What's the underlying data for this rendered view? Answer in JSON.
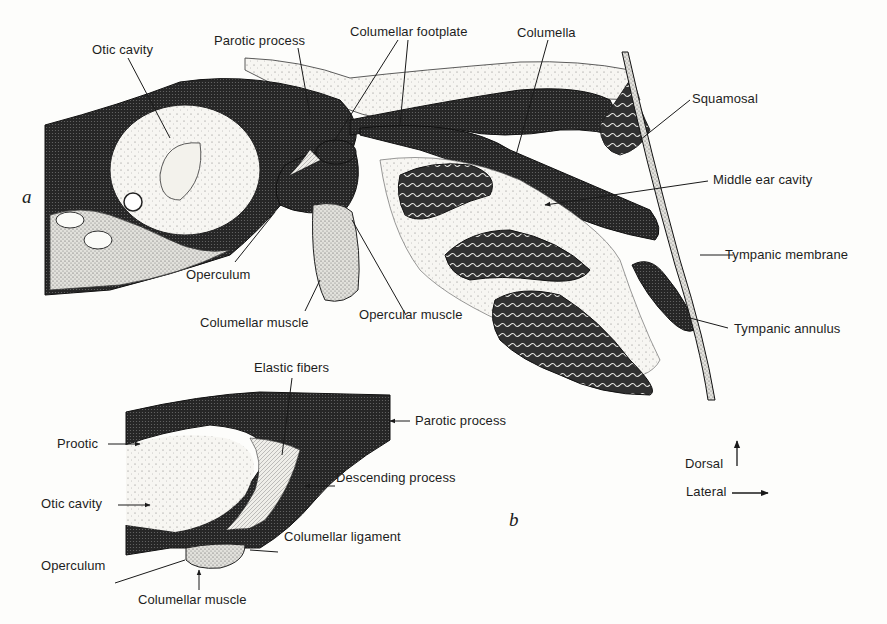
{
  "figure": {
    "panel_a": {
      "letter": "a",
      "labels": {
        "otic_cavity": "Otic cavity",
        "parotic_process": "Parotic process",
        "columellar_footplate": "Columellar footplate",
        "columella": "Columella",
        "squamosal": "Squamosal",
        "middle_ear_cavity": "Middle ear cavity",
        "tympanic_membrane": "Tympanic membrane",
        "tympanic_annulus": "Tympanic annulus",
        "operculum": "Operculum",
        "columellar_muscle": "Columellar muscle",
        "opercular_muscle": "Opercular muscle"
      }
    },
    "panel_b": {
      "letter": "b",
      "labels": {
        "elastic_fibers": "Elastic fibers",
        "parotic_process": "Parotic process",
        "prootic": "Prootic",
        "descending_process": "Descending process",
        "otic_cavity": "Otic cavity",
        "columellar_ligament": "Columellar ligament",
        "operculum": "Operculum",
        "columellar_muscle": "Columellar muscle"
      }
    },
    "orientation": {
      "dorsal": "Dorsal",
      "lateral": "Lateral"
    },
    "colors": {
      "dark_tissue": "#2b2b2b",
      "light_stipple": "#ecebe6",
      "background": "#fdfdfb",
      "ink": "#1a1a1a"
    }
  }
}
